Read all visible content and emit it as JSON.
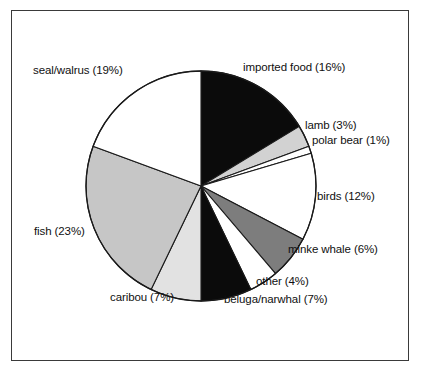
{
  "figure": {
    "background_color": "#ffffff",
    "frame_color": "#3a3a3a",
    "label_text_color": "#101010"
  },
  "chart_data": {
    "type": "pie",
    "title": "",
    "subtitle": "",
    "xlabel": "",
    "ylabel": "",
    "legend_position": "none",
    "grid": false,
    "labels_outside": true,
    "start_angle_clock": 12,
    "direction": "clockwise",
    "categories": [
      "imported food",
      "lamb",
      "polar bear",
      "birds",
      "minke whale",
      "other",
      "beluga/narwhal",
      "caribou",
      "fish",
      "seal/walrus"
    ],
    "values": [
      16,
      3,
      1,
      12,
      6,
      4,
      7,
      7,
      23,
      19
    ],
    "value_unit": "%",
    "slice_colors": [
      "#0b0b0b",
      "#d2d2d2",
      "#ffffff",
      "#ffffff",
      "#7d7d7d",
      "#ffffff",
      "#0b0b0b",
      "#e2e2e2",
      "#c6c6c6",
      "#ffffff"
    ],
    "slice_edge_color": "#1a1a1a",
    "annotations": [
      "imported food (16%)",
      "lamb (3%)",
      "polar bear (1%)",
      "birds (12%)",
      "minke whale (6%)",
      "other (4%)",
      "beluga/narwhal (7%)",
      "caribou (7%)",
      "fish (23%)",
      "seal/walrus (19%)"
    ],
    "slices": [
      {
        "label": "imported food",
        "value": 16,
        "text": "imported food (16%)",
        "color": "#0b0b0b"
      },
      {
        "label": "lamb",
        "value": 3,
        "text": "lamb (3%)",
        "color": "#d2d2d2"
      },
      {
        "label": "polar bear",
        "value": 1,
        "text": "polar bear (1%)",
        "color": "#ffffff"
      },
      {
        "label": "birds",
        "value": 12,
        "text": "birds (12%)",
        "color": "#ffffff"
      },
      {
        "label": "minke whale",
        "value": 6,
        "text": "minke whale (6%)",
        "color": "#7d7d7d"
      },
      {
        "label": "other",
        "value": 4,
        "text": "other (4%)",
        "color": "#ffffff"
      },
      {
        "label": "beluga/narwhal",
        "value": 7,
        "text": "beluga/narwhal (7%)",
        "color": "#0b0b0b"
      },
      {
        "label": "caribou",
        "value": 7,
        "text": "caribou (7%)",
        "color": "#e2e2e2"
      },
      {
        "label": "fish",
        "value": 23,
        "text": "fish (23%)",
        "color": "#c6c6c6"
      },
      {
        "label": "seal/walrus",
        "value": 19,
        "text": "seal/walrus (19%)",
        "color": "#ffffff"
      }
    ]
  }
}
